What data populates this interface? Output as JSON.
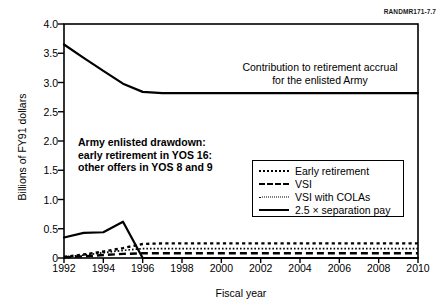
{
  "figure": {
    "source_tag": "RANDMR171-7.7",
    "annotation_lines": [
      "Army enlisted drawdown:",
      "early retirement in YOS 16:",
      "other offers in YOS 8 and 9"
    ],
    "curve_label_lines": [
      "Contribution to retirement accrual",
      "for the enlisted Army"
    ]
  },
  "chart_data": {
    "type": "line",
    "title": "",
    "xlabel": "Fiscal year",
    "ylabel": "Billions of FY91 dollars",
    "xlim": [
      1992,
      2010
    ],
    "ylim": [
      0,
      4.0
    ],
    "xticks": [
      1992,
      1994,
      1996,
      1998,
      2000,
      2002,
      2004,
      2006,
      2008,
      2010
    ],
    "xtick_labels": [
      "1992",
      "1994",
      "1996",
      "1998",
      "2000",
      "2002",
      "2004",
      "2006",
      "2008",
      "2010"
    ],
    "yticks": [
      0,
      0.5,
      1.0,
      1.5,
      2.0,
      2.5,
      3.0,
      3.5,
      4.0
    ],
    "ytick_labels": [
      "0",
      "0.5",
      "1.0",
      "1.5",
      "2.0",
      "2.5",
      "3.0",
      "3.5",
      "4.0"
    ],
    "grid": false,
    "legend_position": "center-right",
    "x": [
      1992,
      1993,
      1994,
      1995,
      1996,
      1997,
      1998,
      1999,
      2000,
      2001,
      2002,
      2003,
      2004,
      2005,
      2006,
      2007,
      2008,
      2009,
      2010
    ],
    "series": [
      {
        "name": "Contribution to retirement accrual for the enlisted Army",
        "style": "solid",
        "in_legend": false,
        "values": [
          3.65,
          3.42,
          3.2,
          2.98,
          2.84,
          2.82,
          2.82,
          2.82,
          2.82,
          2.82,
          2.82,
          2.82,
          2.82,
          2.82,
          2.82,
          2.82,
          2.82,
          2.82,
          2.82
        ]
      },
      {
        "name": "Early retirement",
        "style": "dotted",
        "in_legend": true,
        "values": [
          0.02,
          0.06,
          0.11,
          0.17,
          0.24,
          0.25,
          0.25,
          0.25,
          0.25,
          0.25,
          0.25,
          0.25,
          0.25,
          0.25,
          0.25,
          0.25,
          0.25,
          0.25,
          0.25
        ]
      },
      {
        "name": "VSI",
        "style": "dashed",
        "in_legend": true,
        "values": [
          0.01,
          0.03,
          0.05,
          0.07,
          0.08,
          0.08,
          0.08,
          0.08,
          0.08,
          0.08,
          0.08,
          0.08,
          0.08,
          0.08,
          0.08,
          0.08,
          0.08,
          0.08,
          0.08
        ]
      },
      {
        "name": "VSI with COLAs",
        "style": "fine-dotted",
        "in_legend": true,
        "values": [
          0.02,
          0.05,
          0.09,
          0.13,
          0.16,
          0.16,
          0.16,
          0.16,
          0.16,
          0.16,
          0.16,
          0.16,
          0.16,
          0.16,
          0.16,
          0.16,
          0.16,
          0.16,
          0.16
        ]
      },
      {
        "name": "2.5 × separation pay",
        "style": "solid",
        "in_legend": true,
        "values": [
          0.35,
          0.43,
          0.44,
          0.62,
          0.0,
          0.0,
          0.0,
          0.0,
          0.0,
          0.0,
          0.0,
          0.0,
          0.0,
          0.0,
          0.0,
          0.0,
          0.0,
          0.0,
          0.0
        ]
      }
    ],
    "legend_entries": [
      {
        "label": "Early retirement",
        "style": "dotted"
      },
      {
        "label": "VSI",
        "style": "dashed"
      },
      {
        "label": "VSI with COLAs",
        "style": "fine-dotted"
      },
      {
        "label": "2.5 × separation pay",
        "style": "solid"
      }
    ]
  }
}
